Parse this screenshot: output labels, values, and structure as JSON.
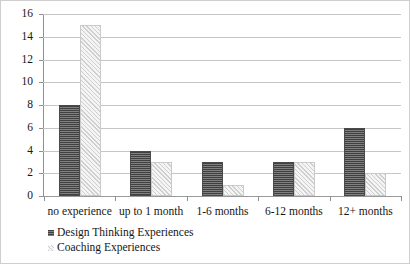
{
  "chart_data": {
    "type": "bar",
    "title": "",
    "subtitle": "",
    "xlabel": "",
    "ylabel": "",
    "ylim": [
      0,
      16
    ],
    "ytick_step": 2,
    "yticks": [
      16,
      14,
      12,
      10,
      8,
      6,
      4,
      2,
      0
    ],
    "grid": true,
    "legend_position": "bottom-left",
    "categories": [
      "no experience",
      "up to 1 month",
      "1-6 months",
      "6-12 months",
      "12+ months"
    ],
    "series": [
      {
        "name": "Design Thinking Experiences",
        "color": "#5c5c5c",
        "pattern": "horizontal-stripes",
        "values": [
          8,
          4,
          3,
          3,
          6
        ]
      },
      {
        "name": "Coaching Experiences",
        "color": "#e4e4e4",
        "pattern": "diagonal-hatch",
        "values": [
          15,
          3,
          1,
          3,
          2
        ]
      }
    ]
  },
  "legend": {
    "items": [
      {
        "label": "Design Thinking Experiences"
      },
      {
        "label": "Coaching Experiences"
      }
    ]
  },
  "style": {
    "gridline_color": "#c6c6c6",
    "axis_color": "#8f8f8f",
    "border_color": "#cfcfcf",
    "text_color": "#161616",
    "background": "#ffffff"
  }
}
